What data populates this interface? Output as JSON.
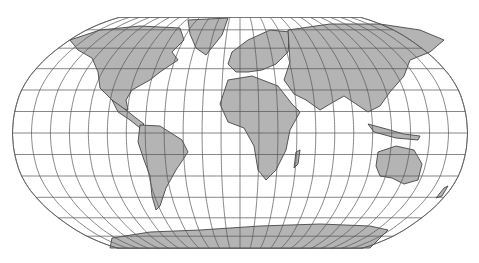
{
  "map": {
    "projection": "Robinson",
    "graticule_step_deg": 15,
    "frame": {
      "left": 12,
      "right": 467,
      "top": 17,
      "bottom": 248,
      "equator_y": 133,
      "center_x": 240
    },
    "colors": {
      "land": "#b4b4b4",
      "graticule": "#555555",
      "background": "#ffffff",
      "coast": "#333333"
    },
    "continents": [
      "North America",
      "South America",
      "Europe",
      "Africa",
      "Asia",
      "Australia",
      "Antarctica",
      "Greenland"
    ]
  }
}
